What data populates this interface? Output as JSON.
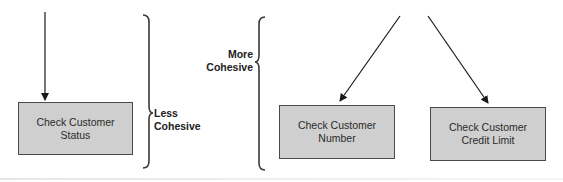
{
  "diagram": {
    "type": "cohesion-comparison",
    "left_side": {
      "module": {
        "line1": "Check Customer",
        "line2": "Status"
      },
      "bracket_label": {
        "line1": "Less",
        "line2": "Cohesive"
      }
    },
    "right_side": {
      "bracket_label": {
        "line1": "More",
        "line2": "Cohesive"
      },
      "modules": [
        {
          "line1": "Check Customer",
          "line2": "Number"
        },
        {
          "line1": "Check Customer",
          "line2": "Credit Limit"
        }
      ]
    },
    "colors": {
      "box_fill": "#cfcfcf",
      "box_border": "#4a4a4a",
      "line": "#1a1a1a",
      "text": "#222222"
    }
  }
}
